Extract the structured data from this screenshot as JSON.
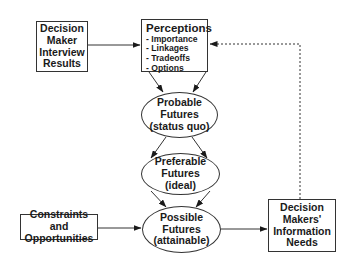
{
  "diagram": {
    "nodes": {
      "decision_maker_interview": {
        "shape": "box",
        "lines": [
          "Decision",
          "Maker",
          "Interview",
          "Results"
        ]
      },
      "perceptions": {
        "shape": "box",
        "title": "Perceptions",
        "items": [
          "- Importance",
          "- Linkages",
          "- Tradeoffs",
          "- Options"
        ]
      },
      "probable_futures": {
        "shape": "ellipse",
        "lines": [
          "Probable",
          "Futures",
          "(status quo)"
        ]
      },
      "preferable_futures": {
        "shape": "ellipse",
        "lines": [
          "Preferable",
          "Futures",
          "(ideal)"
        ]
      },
      "possible_futures": {
        "shape": "ellipse",
        "lines": [
          "Possible",
          "Futures",
          "(attainable)"
        ]
      },
      "constraints_opportunities": {
        "shape": "box",
        "lines": [
          "Constraints and",
          "Opportunities"
        ]
      },
      "information_needs": {
        "shape": "box",
        "lines": [
          "Decision",
          "Makers'",
          "Information",
          "Needs"
        ]
      }
    },
    "edges": [
      {
        "from": "decision_maker_interview",
        "to": "perceptions",
        "style": "solid"
      },
      {
        "from": "perceptions",
        "to": "probable_futures",
        "style": "solid",
        "count": 2
      },
      {
        "from": "probable_futures",
        "to": "preferable_futures",
        "style": "solid",
        "count": 2
      },
      {
        "from": "preferable_futures",
        "to": "possible_futures",
        "style": "solid",
        "count": 2
      },
      {
        "from": "constraints_opportunities",
        "to": "possible_futures",
        "style": "solid"
      },
      {
        "from": "possible_futures",
        "to": "information_needs",
        "style": "solid"
      },
      {
        "from": "information_needs",
        "to": "perceptions",
        "style": "dotted"
      }
    ],
    "colors": {
      "stroke": "#333333",
      "text": "#1a1a1a",
      "background": "#ffffff"
    }
  }
}
